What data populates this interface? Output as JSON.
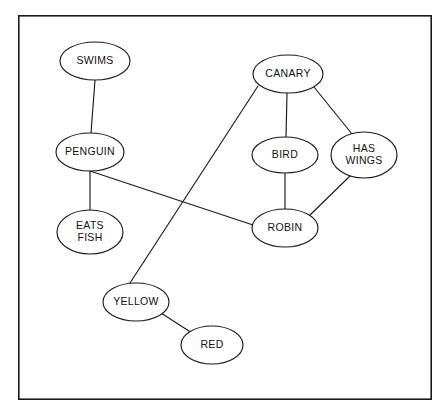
{
  "diagram": {
    "type": "semantic-network",
    "title": "",
    "canvas": {
      "width": 447,
      "height": 416
    },
    "frame": {
      "x": 18,
      "y": 15,
      "width": 414,
      "height": 385,
      "stroke": "#1a1a1a",
      "fill": "#ffffff"
    },
    "style": {
      "node_fill": "#ffffff",
      "node_stroke": "#1a1a1a",
      "edge_stroke": "#1a1a1a",
      "label_color": "#111111",
      "background": "#ffffff"
    },
    "nodes": [
      {
        "id": "swims",
        "label": "SWIMS",
        "lines": [
          "SWIMS"
        ],
        "cx": 95,
        "cy": 61,
        "rx": 35,
        "ry": 19
      },
      {
        "id": "penguin",
        "label": "PENGUIN",
        "lines": [
          "PENGUIN"
        ],
        "cx": 90,
        "cy": 152,
        "rx": 34,
        "ry": 19
      },
      {
        "id": "eats_fish",
        "label": "EATS FISH",
        "lines": [
          "EATS",
          "FISH"
        ],
        "cx": 90,
        "cy": 232,
        "rx": 33,
        "ry": 22
      },
      {
        "id": "canary",
        "label": "CANARY",
        "lines": [
          "CANARY"
        ],
        "cx": 288,
        "cy": 74,
        "rx": 35,
        "ry": 19
      },
      {
        "id": "bird",
        "label": "BIRD",
        "lines": [
          "BIRD"
        ],
        "cx": 285,
        "cy": 155,
        "rx": 33,
        "ry": 18
      },
      {
        "id": "has_wings",
        "label": "HAS WINGS",
        "lines": [
          "HAS",
          "WINGS"
        ],
        "cx": 364,
        "cy": 155,
        "rx": 33,
        "ry": 23
      },
      {
        "id": "robin",
        "label": "ROBIN",
        "lines": [
          "ROBIN"
        ],
        "cx": 285,
        "cy": 228,
        "rx": 33,
        "ry": 19
      },
      {
        "id": "yellow",
        "label": "YELLOW",
        "lines": [
          "YELLOW"
        ],
        "cx": 136,
        "cy": 302,
        "rx": 33,
        "ry": 19
      },
      {
        "id": "red",
        "label": "RED",
        "lines": [
          "RED"
        ],
        "cx": 212,
        "cy": 345,
        "rx": 31,
        "ry": 19
      }
    ],
    "edges": [
      {
        "id": "swims-penguin",
        "from": "swims",
        "to": "penguin",
        "x1": 95,
        "y1": 80,
        "x2": 91,
        "y2": 133
      },
      {
        "id": "penguin-eatsfish",
        "from": "penguin",
        "to": "eats_fish",
        "x1": 90,
        "y1": 171,
        "x2": 90,
        "y2": 210
      },
      {
        "id": "penguin-robin",
        "from": "penguin",
        "to": "robin",
        "x1": 90,
        "y1": 171,
        "x2": 253,
        "y2": 225
      },
      {
        "id": "canary-bird",
        "from": "canary",
        "to": "bird",
        "x1": 287,
        "y1": 93,
        "x2": 286,
        "y2": 137
      },
      {
        "id": "canary-haswings",
        "from": "canary",
        "to": "has_wings",
        "x1": 314,
        "y1": 87,
        "x2": 352,
        "y2": 134
      },
      {
        "id": "canary-yellow",
        "from": "canary",
        "to": "yellow",
        "x1": 258,
        "y1": 86,
        "x2": 130,
        "y2": 283
      },
      {
        "id": "bird-robin",
        "from": "bird",
        "to": "robin",
        "x1": 285,
        "y1": 173,
        "x2": 285,
        "y2": 209
      },
      {
        "id": "robin-haswings",
        "from": "robin",
        "to": "has_wings",
        "x1": 309,
        "y1": 216,
        "x2": 351,
        "y2": 175
      },
      {
        "id": "yellow-red",
        "from": "yellow",
        "to": "red",
        "x1": 161,
        "y1": 313,
        "x2": 192,
        "y2": 333
      }
    ]
  }
}
